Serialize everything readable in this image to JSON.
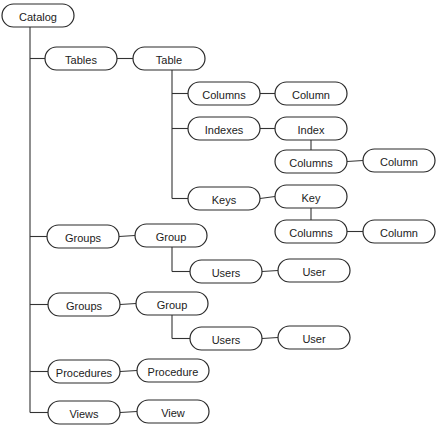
{
  "diagram": {
    "type": "tree",
    "nodes": [
      {
        "id": "catalog",
        "label": "Catalog"
      },
      {
        "id": "tables",
        "label": "Tables"
      },
      {
        "id": "table",
        "label": "Table"
      },
      {
        "id": "t_columns",
        "label": "Columns"
      },
      {
        "id": "t_column",
        "label": "Column"
      },
      {
        "id": "indexes",
        "label": "Indexes"
      },
      {
        "id": "index",
        "label": "Index"
      },
      {
        "id": "i_columns",
        "label": "Columns"
      },
      {
        "id": "i_column",
        "label": "Column"
      },
      {
        "id": "keys",
        "label": "Keys"
      },
      {
        "id": "key",
        "label": "Key"
      },
      {
        "id": "k_columns",
        "label": "Columns"
      },
      {
        "id": "k_column",
        "label": "Column"
      },
      {
        "id": "groups1",
        "label": "Groups"
      },
      {
        "id": "group1",
        "label": "Group"
      },
      {
        "id": "users1",
        "label": "Users"
      },
      {
        "id": "user1",
        "label": "User"
      },
      {
        "id": "groups2",
        "label": "Groups"
      },
      {
        "id": "group2",
        "label": "Group"
      },
      {
        "id": "users2",
        "label": "Users"
      },
      {
        "id": "user2",
        "label": "User"
      },
      {
        "id": "procedures",
        "label": "Procedures"
      },
      {
        "id": "procedure",
        "label": "Procedure"
      },
      {
        "id": "views",
        "label": "Views"
      },
      {
        "id": "view",
        "label": "View"
      }
    ],
    "edges": [
      [
        "catalog",
        "tables"
      ],
      [
        "tables",
        "table"
      ],
      [
        "table",
        "t_columns"
      ],
      [
        "t_columns",
        "t_column"
      ],
      [
        "table",
        "indexes"
      ],
      [
        "indexes",
        "index"
      ],
      [
        "index",
        "i_columns"
      ],
      [
        "i_columns",
        "i_column"
      ],
      [
        "table",
        "keys"
      ],
      [
        "keys",
        "key"
      ],
      [
        "key",
        "k_columns"
      ],
      [
        "k_columns",
        "k_column"
      ],
      [
        "catalog",
        "groups1"
      ],
      [
        "groups1",
        "group1"
      ],
      [
        "group1",
        "users1"
      ],
      [
        "users1",
        "user1"
      ],
      [
        "catalog",
        "groups2"
      ],
      [
        "groups2",
        "group2"
      ],
      [
        "group2",
        "users2"
      ],
      [
        "users2",
        "user2"
      ],
      [
        "catalog",
        "procedures"
      ],
      [
        "procedures",
        "procedure"
      ],
      [
        "catalog",
        "views"
      ],
      [
        "views",
        "view"
      ]
    ]
  }
}
